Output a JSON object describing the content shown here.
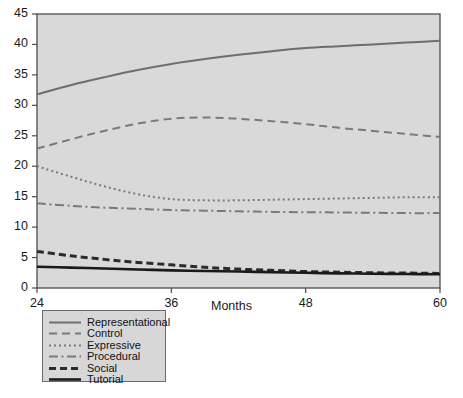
{
  "chart_data": {
    "type": "line",
    "title": "",
    "xlabel": "Months",
    "ylabel": "",
    "xlim": [
      24,
      60
    ],
    "ylim": [
      0,
      45
    ],
    "xticks": [
      24,
      36,
      48,
      60
    ],
    "yticks": [
      0,
      5,
      10,
      15,
      20,
      25,
      30,
      35,
      40,
      45
    ],
    "grid": false,
    "legend_position": "below-left",
    "plot_background": "#d9d9d9",
    "frame_color": "#4d4d4d",
    "x": [
      24,
      27,
      30,
      33,
      36,
      39,
      42,
      45,
      48,
      51,
      54,
      57,
      60
    ],
    "series": [
      {
        "name": "Representational",
        "color": "#6e6e6e",
        "style": "solid",
        "width": 2.0,
        "values": [
          31.8,
          33.3,
          34.6,
          35.8,
          36.8,
          37.6,
          38.3,
          38.9,
          39.4,
          39.7,
          40.0,
          40.3,
          40.6
        ]
      },
      {
        "name": "Control",
        "color": "#7a7a7a",
        "style": "dashed",
        "width": 2.0,
        "values": [
          22.9,
          24.4,
          25.8,
          27.0,
          27.8,
          28.0,
          27.8,
          27.4,
          26.9,
          26.3,
          25.8,
          25.3,
          24.8
        ]
      },
      {
        "name": "Expressive",
        "color": "#7a7a7a",
        "style": "dotted",
        "width": 2.0,
        "values": [
          20.0,
          18.3,
          16.7,
          15.4,
          14.6,
          14.4,
          14.4,
          14.5,
          14.6,
          14.7,
          14.8,
          14.9,
          14.9
        ]
      },
      {
        "name": "Procedural",
        "color": "#7a7a7a",
        "style": "dashdot",
        "width": 2.0,
        "values": [
          13.9,
          13.5,
          13.2,
          13.0,
          12.8,
          12.7,
          12.6,
          12.5,
          12.45,
          12.4,
          12.35,
          12.3,
          12.3
        ]
      },
      {
        "name": "Social",
        "color": "#2b2b2b",
        "style": "dashed",
        "width": 3.0,
        "values": [
          6.0,
          5.3,
          4.7,
          4.2,
          3.8,
          3.4,
          3.1,
          2.9,
          2.7,
          2.6,
          2.5,
          2.45,
          2.4
        ]
      },
      {
        "name": "Tutorial",
        "color": "#1a1a1a",
        "style": "solid",
        "width": 2.6,
        "values": [
          3.5,
          3.35,
          3.2,
          3.05,
          2.9,
          2.8,
          2.7,
          2.6,
          2.5,
          2.4,
          2.35,
          2.3,
          2.25
        ]
      }
    ]
  },
  "axes": {
    "y_tick_labels": [
      "45",
      "40",
      "35",
      "30",
      "25",
      "20",
      "15",
      "10",
      "5",
      "0"
    ],
    "x_tick_labels": [
      "24",
      "36",
      "48",
      "60"
    ],
    "x_axis_title": "Months"
  },
  "legend": {
    "items": [
      {
        "label": "Representational"
      },
      {
        "label": "Control"
      },
      {
        "label": "Expressive"
      },
      {
        "label": "Procedural"
      },
      {
        "label": "Social"
      },
      {
        "label": "Tutorial"
      }
    ]
  }
}
